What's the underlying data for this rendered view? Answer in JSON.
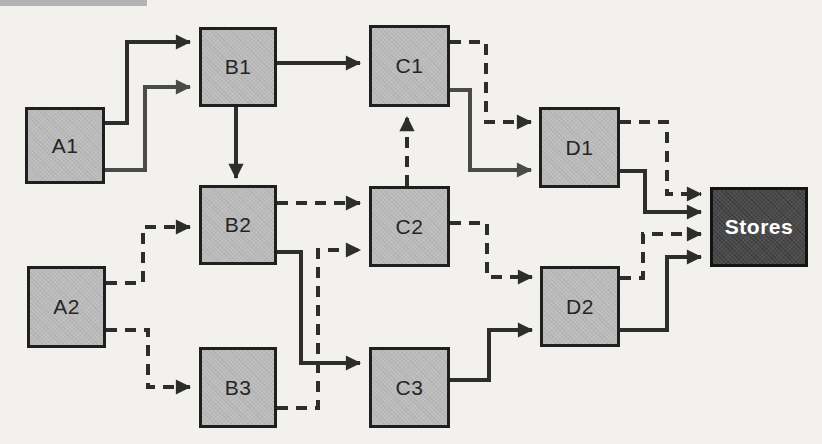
{
  "diagram": {
    "background_color": "#f2f1ee",
    "colors": {
      "dark": "#2d2d2d",
      "gray": "#4a4a4a",
      "node_fill": "#bcbcbc",
      "node_border": "#1f1f1f",
      "store_fill": "#4b4b4b",
      "store_text": "#ffffff"
    },
    "scan_artifact_bar": {
      "x": 0,
      "y": 0,
      "w": 147,
      "h": 6,
      "color": "#b3b3b3"
    },
    "nodes": [
      {
        "id": "A1",
        "label": "A1",
        "x": 25,
        "y": 107,
        "w": 80,
        "h": 77,
        "variant": "plain"
      },
      {
        "id": "A2",
        "label": "A2",
        "x": 27,
        "y": 266,
        "w": 79,
        "h": 82,
        "variant": "plain"
      },
      {
        "id": "B1",
        "label": "B1",
        "x": 199,
        "y": 27,
        "w": 78,
        "h": 80,
        "variant": "plain"
      },
      {
        "id": "B2",
        "label": "B2",
        "x": 199,
        "y": 185,
        "w": 78,
        "h": 80,
        "variant": "plain"
      },
      {
        "id": "B3",
        "label": "B3",
        "x": 199,
        "y": 347,
        "w": 78,
        "h": 81,
        "variant": "plain"
      },
      {
        "id": "C1",
        "label": "C1",
        "x": 369,
        "y": 25,
        "w": 81,
        "h": 82,
        "variant": "plain"
      },
      {
        "id": "C2",
        "label": "C2",
        "x": 369,
        "y": 186,
        "w": 81,
        "h": 81,
        "variant": "plain"
      },
      {
        "id": "C3",
        "label": "C3",
        "x": 369,
        "y": 347,
        "w": 81,
        "h": 81,
        "variant": "plain"
      },
      {
        "id": "D1",
        "label": "D1",
        "x": 539,
        "y": 107,
        "w": 81,
        "h": 81,
        "variant": "plain"
      },
      {
        "id": "D2",
        "label": "D2",
        "x": 540,
        "y": 266,
        "w": 80,
        "h": 81,
        "variant": "plain"
      },
      {
        "id": "Stores",
        "label": "Stores",
        "x": 710,
        "y": 187,
        "w": 98,
        "h": 80,
        "variant": "store"
      }
    ],
    "edges": [
      {
        "from": "A1",
        "to": "B1",
        "style": "solid",
        "tone": "dark",
        "points": [
          [
            105,
            123
          ],
          [
            127,
            123
          ],
          [
            127,
            42
          ],
          [
            190,
            42
          ]
        ]
      },
      {
        "from": "A1",
        "to": "B1",
        "style": "solid",
        "tone": "gray",
        "points": [
          [
            105,
            170
          ],
          [
            145,
            170
          ],
          [
            145,
            87
          ],
          [
            190,
            87
          ]
        ]
      },
      {
        "from": "B1",
        "to": "C1",
        "style": "solid",
        "tone": "dark",
        "points": [
          [
            277,
            63
          ],
          [
            360,
            63
          ]
        ]
      },
      {
        "from": "B1",
        "to": "B2",
        "style": "solid",
        "tone": "dark",
        "points": [
          [
            236,
            107
          ],
          [
            236,
            178
          ]
        ]
      },
      {
        "from": "A2",
        "to": "B2",
        "style": "dashed",
        "tone": "dark",
        "points": [
          [
            106,
            283
          ],
          [
            143,
            283
          ],
          [
            143,
            227
          ],
          [
            190,
            227
          ]
        ]
      },
      {
        "from": "A2",
        "to": "B3",
        "style": "dashed",
        "tone": "dark",
        "points": [
          [
            106,
            330
          ],
          [
            148,
            330
          ],
          [
            148,
            387
          ],
          [
            190,
            387
          ]
        ]
      },
      {
        "from": "B2",
        "to": "C2",
        "style": "dashed",
        "tone": "dark",
        "points": [
          [
            277,
            203
          ],
          [
            360,
            203
          ]
        ]
      },
      {
        "from": "B2",
        "to": "C3",
        "style": "solid",
        "tone": "dark",
        "points": [
          [
            277,
            252
          ],
          [
            301,
            252
          ],
          [
            301,
            363
          ],
          [
            360,
            363
          ]
        ]
      },
      {
        "from": "B3",
        "to": "C2",
        "style": "dashed",
        "tone": "dark",
        "points": [
          [
            277,
            408
          ],
          [
            318,
            408
          ],
          [
            318,
            250
          ],
          [
            360,
            250
          ]
        ]
      },
      {
        "from": "C2",
        "to": "C1",
        "style": "dashed",
        "tone": "dark",
        "points": [
          [
            407,
            186
          ],
          [
            407,
            117
          ]
        ]
      },
      {
        "from": "C1",
        "to": "D1",
        "style": "dashed",
        "tone": "dark",
        "points": [
          [
            450,
            42
          ],
          [
            486,
            42
          ],
          [
            486,
            122
          ],
          [
            531,
            122
          ]
        ]
      },
      {
        "from": "C1",
        "to": "D1",
        "style": "solid",
        "tone": "gray",
        "points": [
          [
            450,
            90
          ],
          [
            470,
            90
          ],
          [
            470,
            170
          ],
          [
            531,
            170
          ]
        ]
      },
      {
        "from": "C2",
        "to": "D2",
        "style": "dashed",
        "tone": "dark",
        "points": [
          [
            450,
            223
          ],
          [
            487,
            223
          ],
          [
            487,
            277
          ],
          [
            532,
            277
          ]
        ]
      },
      {
        "from": "C3",
        "to": "D2",
        "style": "solid",
        "tone": "dark",
        "points": [
          [
            450,
            380
          ],
          [
            489,
            380
          ],
          [
            489,
            330
          ],
          [
            532,
            330
          ]
        ]
      },
      {
        "from": "D1",
        "to": "Stores",
        "style": "dashed",
        "tone": "dark",
        "points": [
          [
            620,
            122
          ],
          [
            667,
            122
          ],
          [
            667,
            194
          ],
          [
            701,
            194
          ]
        ]
      },
      {
        "from": "D1",
        "to": "Stores",
        "style": "solid",
        "tone": "dark",
        "points": [
          [
            620,
            171
          ],
          [
            645,
            171
          ],
          [
            645,
            212
          ],
          [
            701,
            212
          ]
        ]
      },
      {
        "from": "D2",
        "to": "Stores",
        "style": "dashed",
        "tone": "dark",
        "points": [
          [
            620,
            278
          ],
          [
            643,
            278
          ],
          [
            643,
            234
          ],
          [
            701,
            234
          ]
        ]
      },
      {
        "from": "D2",
        "to": "Stores",
        "style": "solid",
        "tone": "dark",
        "points": [
          [
            620,
            330
          ],
          [
            667,
            330
          ],
          [
            667,
            257
          ],
          [
            701,
            257
          ]
        ]
      }
    ],
    "style": {
      "stroke_width": 4,
      "dash_array": "11 8"
    }
  }
}
